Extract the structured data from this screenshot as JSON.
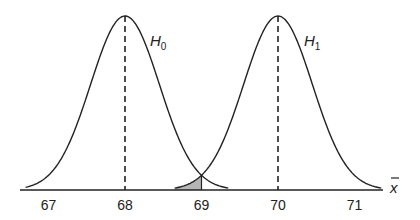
{
  "chart_data": {
    "type": "line",
    "title": "",
    "xlabel": "x̄",
    "ylabel": "",
    "xlim": [
      66.7,
      71.4
    ],
    "x_ticks": [
      "67",
      "68",
      "69",
      "70",
      "71"
    ],
    "grid": false,
    "series": [
      {
        "name": "H0",
        "mean": 68,
        "sd": 0.45,
        "curve_range": [
          66.7,
          69.35
        ]
      },
      {
        "name": "H1",
        "mean": 70,
        "sd": 0.45,
        "curve_range": [
          68.65,
          71.35
        ]
      }
    ],
    "mean_lines": [
      68,
      70
    ],
    "shaded_region": {
      "under": "H1",
      "from": 68.65,
      "to": 69,
      "color": "#b5b5b5"
    },
    "annotations": [
      {
        "text": "H0",
        "near": "H0 curve right shoulder"
      },
      {
        "text": "H1",
        "near": "H1 curve right shoulder"
      }
    ]
  },
  "labels": {
    "h0_main": "H",
    "h0_sub": "0",
    "h1_main": "H",
    "h1_sub": "1",
    "xaxis": "x",
    "ticks": [
      "67",
      "68",
      "69",
      "70",
      "71"
    ]
  }
}
